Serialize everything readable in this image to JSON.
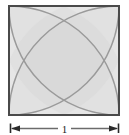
{
  "figure": {
    "background_color": "#ffffff",
    "square": {
      "name": "unit-square",
      "side_label": "1",
      "stroke_color": "#4a4a4a",
      "stroke_width": 2.0,
      "fill_color": "#f1f1f1",
      "x": 9,
      "y": 6,
      "width": 110,
      "height": 109
    },
    "arcs": {
      "count": 4,
      "description": "quarter circles of radius 1 centered at each corner of the square",
      "stroke_color": "#9a9a9a",
      "stroke_width": 1.4,
      "centers": [
        "top-left",
        "top-right",
        "bottom-right",
        "bottom-left"
      ],
      "radius_label": "1"
    },
    "petal_fill_color": "#ebebeb",
    "dimension": {
      "name": "bottom-width-dimension",
      "label": "1",
      "line_color": "#6b6b6b",
      "arrow_color": "#2b2b2b",
      "tick_color": "#2b2b2b",
      "y": 128,
      "x_start": 10,
      "x_end": 119,
      "label_x": 64.5
    }
  }
}
